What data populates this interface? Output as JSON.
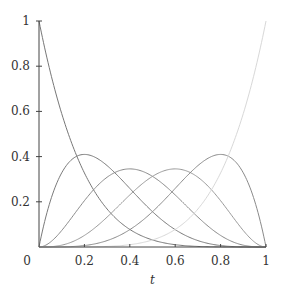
{
  "chart_data": {
    "type": "line",
    "title": "",
    "xlabel": "t",
    "ylabel": "",
    "xlim": [
      0,
      1
    ],
    "ylim": [
      0,
      1
    ],
    "grid": false,
    "legend": null,
    "x_ticks": [
      "0",
      "0.2",
      "0.4",
      "0.6",
      "0.8",
      "1"
    ],
    "y_ticks": [
      "0.2",
      "0.4",
      "0.6",
      "0.8",
      "1"
    ],
    "series": [
      {
        "name": "B0,5 = (1-t)^5",
        "k": 0,
        "color": "#777777",
        "peak": {
          "t": 0.0,
          "value": 1.0
        }
      },
      {
        "name": "B1,5 = 5t(1-t)^4",
        "k": 1,
        "color": "#7a7a7a",
        "peak": {
          "t": 0.2,
          "value": 0.41
        }
      },
      {
        "name": "B2,5 = 10t^2(1-t)^3",
        "k": 2,
        "color": "#8a8a8a",
        "peak": {
          "t": 0.4,
          "value": 0.35
        }
      },
      {
        "name": "B3,5 = 10t^3(1-t)^2",
        "k": 3,
        "color": "#999999",
        "peak": {
          "t": 0.6,
          "value": 0.35
        }
      },
      {
        "name": "B4,5 = 5t^4(1-t)",
        "k": 4,
        "color": "#8a8a8a",
        "peak": {
          "t": 0.8,
          "value": 0.41
        }
      },
      {
        "name": "B5,5 = t^5",
        "k": 5,
        "color": "#d8d8d8",
        "peak": {
          "t": 1.0,
          "value": 1.0
        }
      }
    ]
  }
}
